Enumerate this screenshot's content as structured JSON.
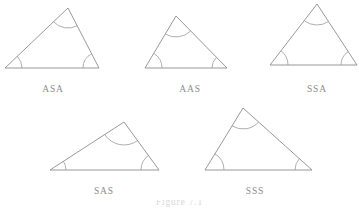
{
  "page": {
    "background_color": "#ffffff",
    "stroke_color": "#8d8d8d",
    "arc_color": "#9a9a9a",
    "label_color": "#8d8d8d",
    "width": 359,
    "height": 208
  },
  "figures": [
    {
      "id": "asa",
      "label": "ASA",
      "label_x": 53,
      "label_y": 91,
      "vertices": {
        "left": [
          5,
          68
        ],
        "apex": [
          68,
          8
        ],
        "right": [
          99,
          68
        ]
      },
      "marked_angles": [
        "left",
        "apex",
        "right"
      ],
      "arc_radii": {
        "left": 17,
        "apex": 20,
        "right": 16
      }
    },
    {
      "id": "aas",
      "label": "AAS",
      "label_x": 190,
      "label_y": 91,
      "vertices": {
        "left": [
          145,
          68
        ],
        "apex": [
          176,
          16
        ],
        "right": [
          227,
          68
        ]
      },
      "marked_angles": [
        "left",
        "apex",
        "right"
      ],
      "arc_radii": {
        "left": 17,
        "apex": 21,
        "right": 15
      }
    },
    {
      "id": "ssa",
      "label": "SSA",
      "label_x": 317,
      "label_y": 91,
      "vertices": {
        "left": [
          270,
          65
        ],
        "apex": [
          317,
          4
        ],
        "right": [
          357,
          65
        ]
      },
      "marked_angles": [
        "left",
        "apex",
        "right"
      ],
      "arc_radii": {
        "left": 18,
        "apex": 21,
        "right": 16
      }
    },
    {
      "id": "sas",
      "label": "SAS",
      "label_x": 104,
      "label_y": 193,
      "vertices": {
        "left": [
          50,
          170
        ],
        "apex": [
          124,
          122
        ],
        "right": [
          159,
          170
        ]
      },
      "marked_angles": [
        "left",
        "apex",
        "right"
      ],
      "arc_radii": {
        "left": 16,
        "apex": 23,
        "right": 18
      }
    },
    {
      "id": "sss",
      "label": "SSS",
      "label_x": 255,
      "label_y": 193,
      "vertices": {
        "left": [
          205,
          170
        ],
        "apex": [
          243,
          108
        ],
        "right": [
          312,
          170
        ]
      },
      "marked_angles": [
        "left",
        "apex",
        "right"
      ],
      "arc_radii": {
        "left": 19,
        "apex": 21,
        "right": 17
      }
    }
  ],
  "caption": {
    "text": "Figure 7.1",
    "clip_top": 200
  }
}
